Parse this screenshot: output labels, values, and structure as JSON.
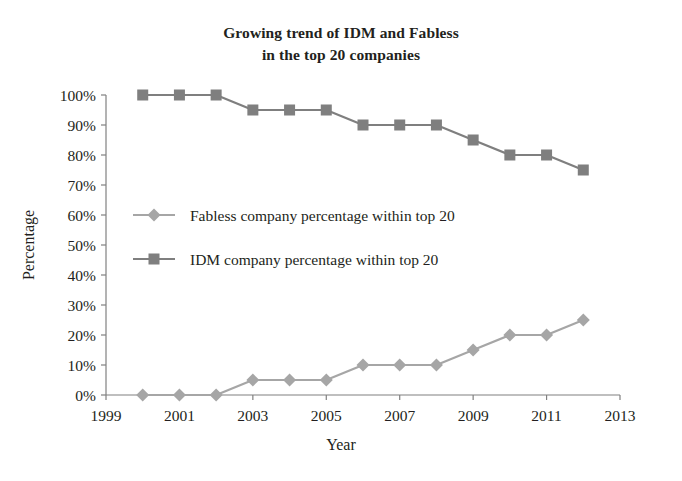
{
  "chart_data": {
    "type": "line",
    "title": "Growing trend of IDM and Fabless in the top 20 companies",
    "title_lines": [
      "Growing trend of IDM and Fabless",
      "in the top 20 companies"
    ],
    "xlabel": "Year",
    "ylabel": "Percentage",
    "x": [
      2000,
      2001,
      2002,
      2003,
      2004,
      2005,
      2006,
      2007,
      2008,
      2009,
      2010,
      2011,
      2012
    ],
    "xlim": [
      1999,
      2013
    ],
    "ylim": [
      0,
      100
    ],
    "xticks": [
      1999,
      2001,
      2003,
      2005,
      2007,
      2009,
      2011,
      2013
    ],
    "xtick_labels": [
      "1999",
      "2001",
      "2003",
      "2005",
      "2007",
      "2009",
      "2011",
      "2013"
    ],
    "yticks": [
      0,
      10,
      20,
      30,
      40,
      50,
      60,
      70,
      80,
      90,
      100
    ],
    "ytick_labels": [
      "0%",
      "10%",
      "20%",
      "30%",
      "40%",
      "50%",
      "60%",
      "70%",
      "80%",
      "90%",
      "100%"
    ],
    "grid": false,
    "legend_position": "center-left-inside",
    "series": [
      {
        "name": "Fabless company percentage within top 20",
        "marker": "diamond",
        "color": "#a6a6a6",
        "values": [
          0,
          0,
          0,
          5,
          5,
          5,
          10,
          10,
          10,
          15,
          20,
          20,
          25
        ]
      },
      {
        "name": "IDM company percentage within top 20",
        "marker": "square",
        "color": "#7f7f7f",
        "values": [
          100,
          100,
          100,
          95,
          95,
          95,
          90,
          90,
          90,
          85,
          80,
          80,
          75
        ]
      }
    ]
  },
  "legend": {
    "items": [
      {
        "label": "Fabless company percentage within top 20"
      },
      {
        "label": "IDM company percentage within top 20"
      }
    ]
  },
  "colors": {
    "axis": "#808080",
    "text": "#231f20",
    "fabless": "#a6a6a6",
    "idm": "#7f7f7f",
    "background": "#ffffff"
  }
}
